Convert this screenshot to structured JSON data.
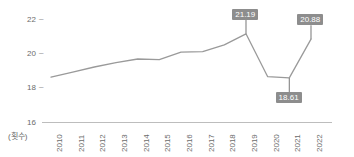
{
  "chart_data": {
    "type": "line",
    "title": "",
    "subtitle": "",
    "xlabel": "",
    "ylabel": "",
    "unit_label": "(횟수)",
    "grid": false,
    "legend": "none",
    "categories": [
      "2010",
      "2011",
      "2012",
      "2013",
      "2014",
      "2015",
      "2016",
      "2017",
      "2018",
      "2019",
      "2020",
      "2021",
      "2022"
    ],
    "series": [
      {
        "name": "횟수",
        "values": [
          18.65,
          18.95,
          19.25,
          19.5,
          19.72,
          19.68,
          20.12,
          20.15,
          20.55,
          21.19,
          18.68,
          18.61,
          20.88
        ]
      }
    ],
    "ylim": [
      16,
      22.6
    ],
    "yticks": [
      22,
      20,
      18,
      16
    ],
    "ytick_labels": [
      "22",
      "20",
      "18",
      "16"
    ],
    "xtick_labels": [
      "2010",
      "2011",
      "2012",
      "2013",
      "2014",
      "2015",
      "2016",
      "2017",
      "2018",
      "2019",
      "2020",
      "2021",
      "2022"
    ],
    "annotations": [
      {
        "label": "21.19",
        "category": "2019",
        "value": 21.19,
        "position": "above"
      },
      {
        "label": "18.61",
        "category": "2021",
        "value": 18.61,
        "position": "below"
      },
      {
        "label": "20.88",
        "category": "2022",
        "value": 20.88,
        "position": "above"
      }
    ],
    "colors": {
      "line": "#9a9a9a",
      "axis": "#bdbdbd",
      "tick_text": "#6b6b6b",
      "callout_bg": "#8d8d8d",
      "callout_text": "#ffffff",
      "background": "#ffffff"
    }
  }
}
